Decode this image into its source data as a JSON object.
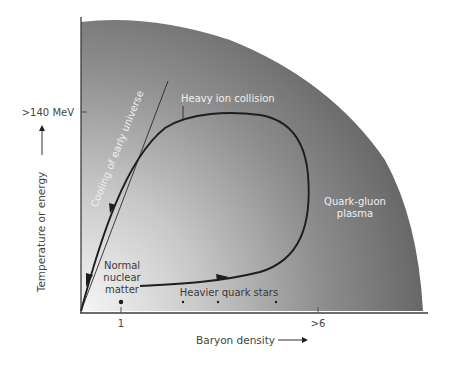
{
  "diagram": {
    "type": "phase-diagram",
    "title": "",
    "axes": {
      "x": {
        "label": "Baryon density",
        "ticks": [
          {
            "label": "1",
            "x": 121
          },
          {
            "label": ">6",
            "x": 318
          }
        ]
      },
      "y": {
        "label": "Temperature or energy",
        "ticks": [
          {
            "label": ">140 MeV",
            "y": 112
          }
        ]
      }
    },
    "regions": {
      "outer": {
        "label_line1": "Quark-gluon",
        "label_line2": "plasma"
      },
      "inner": {
        "label_line1": "Normal",
        "label_line2": "nuclear",
        "label_line3": "matter"
      }
    },
    "paths": {
      "cooling": {
        "label": "Cooling of early universe"
      },
      "collision": {
        "label": "Heavy ion collision"
      }
    },
    "markers": {
      "heavier_quark_stars": {
        "label": "Heavier quark stars"
      }
    },
    "colors": {
      "gradient_light": "#f4f4f4",
      "gradient_mid": "#b9b9b9",
      "gradient_dark": "#6a6a6a",
      "line": "#222222",
      "axis": "#444444",
      "label_on_dark": "#f0f0f0",
      "label_on_light": "#3a3a3a"
    }
  }
}
